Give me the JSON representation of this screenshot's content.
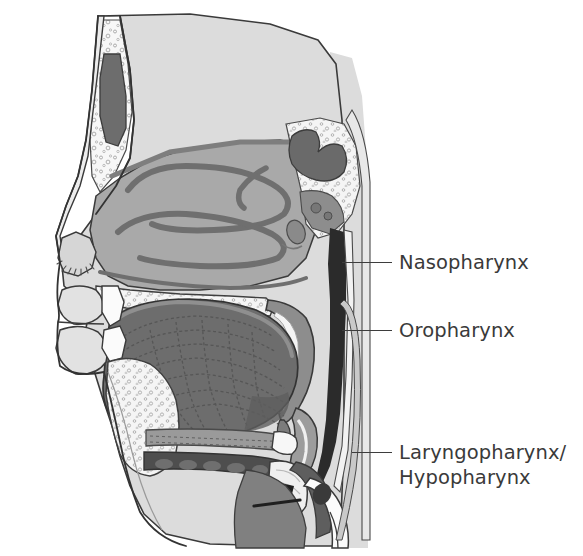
{
  "figure": {
    "kind": "anatomical-illustration",
    "view": "mid-sagittal section of head and neck",
    "background_color": "#ffffff",
    "width": 583,
    "height": 556
  },
  "palette": {
    "background": "#ffffff",
    "outline": "#2f2f2f",
    "skin_light": "#dcdcdc",
    "skin_shadow": "#cfcfcf",
    "mucosa_mid": "#a9a9a9",
    "mucosa_dark": "#8d8d8d",
    "tissue_dark": "#6d6d6d",
    "tissue_darker": "#5a5a5a",
    "airway_black": "#2b2b2b",
    "bone_white": "#f7f7f7",
    "cartilage": "#c4c4c4",
    "label_text": "#3a3a3a",
    "leader_line": "#3d3d3d"
  },
  "labels": [
    {
      "id": "nasopharynx",
      "text": "Nasopharynx",
      "lines": [
        "Nasopharynx"
      ],
      "text_x": 399,
      "text_y": 250,
      "leader": {
        "x1": 342,
        "y1": 262,
        "x2": 392,
        "y2": 262
      }
    },
    {
      "id": "oropharynx",
      "text": "Oropharynx",
      "lines": [
        "Oropharynx"
      ],
      "text_x": 399,
      "text_y": 318,
      "leader": {
        "x1": 342,
        "y1": 330,
        "x2": 392,
        "y2": 330
      }
    },
    {
      "id": "laryngopharynx",
      "text": "Laryngopharynx/ Hypopharynx",
      "lines": [
        "Laryngopharynx/",
        "Hypopharynx"
      ],
      "text_x": 399,
      "text_y": 440,
      "leader": {
        "x1": 352,
        "y1": 452,
        "x2": 392,
        "y2": 452
      }
    }
  ],
  "structures": [
    {
      "id": "frontal-sinus",
      "name": "Frontal sinus"
    },
    {
      "id": "nasal-bone",
      "name": "Nasal bone"
    },
    {
      "id": "superior-concha",
      "name": "Superior nasal concha"
    },
    {
      "id": "middle-concha",
      "name": "Middle nasal concha"
    },
    {
      "id": "inferior-concha",
      "name": "Inferior nasal concha"
    },
    {
      "id": "sphenoid-sinus",
      "name": "Sphenoid sinus"
    },
    {
      "id": "nasal-vestibule",
      "name": "Nasal vestibule with vibrissae"
    },
    {
      "id": "hard-palate",
      "name": "Hard palate"
    },
    {
      "id": "soft-palate",
      "name": "Soft palate"
    },
    {
      "id": "uvula",
      "name": "Uvula"
    },
    {
      "id": "tongue",
      "name": "Tongue"
    },
    {
      "id": "upper-lip",
      "name": "Upper lip"
    },
    {
      "id": "lower-lip",
      "name": "Lower lip"
    },
    {
      "id": "incisor-teeth",
      "name": "Incisor teeth"
    },
    {
      "id": "mandible",
      "name": "Mandible"
    },
    {
      "id": "geniohyoid",
      "name": "Geniohyoid muscle"
    },
    {
      "id": "epiglottis",
      "name": "Epiglottis"
    },
    {
      "id": "hyoid",
      "name": "Hyoid bone"
    },
    {
      "id": "thyroid-cartilage",
      "name": "Thyroid cartilage"
    },
    {
      "id": "vocal-fold",
      "name": "Vocal fold"
    },
    {
      "id": "cricoid-cartilage",
      "name": "Cricoid cartilage"
    },
    {
      "id": "trachea",
      "name": "Trachea"
    },
    {
      "id": "esophagus",
      "name": "Esophagus"
    },
    {
      "id": "pharyngeal-airway",
      "name": "Pharyngeal airway column"
    },
    {
      "id": "clivus",
      "name": "Clivus / skull base"
    },
    {
      "id": "cervical-spine",
      "name": "Cervical vertebrae"
    }
  ]
}
